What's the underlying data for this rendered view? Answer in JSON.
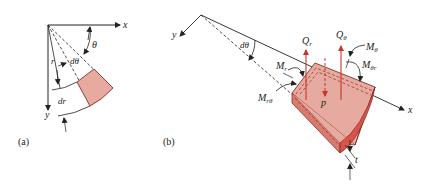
{
  "figure": {
    "panel_a": {
      "caption": "(a)",
      "labels": {
        "x_axis": "x",
        "y_axis": "y",
        "theta": "θ",
        "r": "r",
        "dtheta": "dθ",
        "dr": "dr"
      }
    },
    "panel_b": {
      "caption": "(b)",
      "labels": {
        "x_axis": "x",
        "y_axis": "y",
        "dtheta": "dθ",
        "Qr": "Q",
        "Qr_sub": "r",
        "Qtheta": "Q",
        "Qtheta_sub": "θ",
        "Mtheta": "M",
        "Mtheta_sub": "θ",
        "Mthetar": "M",
        "Mthetar_sub": "θr",
        "Mr": "M",
        "Mr_sub": "r",
        "Mrtheta": "M",
        "Mrtheta_sub": "rθ",
        "p": "p",
        "t": "t"
      }
    },
    "colors": {
      "element_fill": "#e7aaa0",
      "element_edge": "#8a2f22",
      "side_face": "#d9534a",
      "force_arrow": "#c8352a",
      "line": "#222222"
    }
  }
}
